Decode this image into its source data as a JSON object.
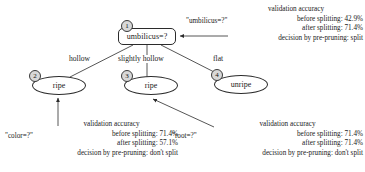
{
  "diagram": {
    "type": "decision-tree-pre-pruning",
    "nodes": [
      {
        "id": "1",
        "label": "umbilicus=?",
        "shape": "rounded-rect"
      },
      {
        "id": "2",
        "label": "ripe",
        "shape": "ellipse"
      },
      {
        "id": "3",
        "label": "ripe",
        "shape": "ellipse"
      },
      {
        "id": "4",
        "label": "unripe",
        "shape": "ellipse"
      }
    ],
    "edges": [
      {
        "from": "1",
        "to": "2",
        "label": "hollow"
      },
      {
        "from": "1",
        "to": "3",
        "label": "slightly hollow"
      },
      {
        "from": "1",
        "to": "4",
        "label": "flat"
      }
    ],
    "annotations": [
      {
        "id": "root-annotation",
        "attribute": "\"umbilicus=?\"",
        "title": "validation accuracy",
        "before_splitting": "before splitting: 42.9%",
        "after_splitting": "after splitting: 71.4%",
        "decision": "decision by pre-pruning: split",
        "target_node": "1"
      },
      {
        "id": "left-annotation",
        "attribute": "\"color=?\"",
        "title": "validation accuracy",
        "before_splitting": "before splitting: 71.4%",
        "after_splitting": "after splitting: 57.1%",
        "decision": "decision by pre-pruning: don't split",
        "target_node": "2"
      },
      {
        "id": "right-annotation",
        "attribute": "\"root=?\"",
        "title": "validation accuracy",
        "before_splitting": "before splitting: 71.4%",
        "after_splitting": "after splitting: 71.4%",
        "decision": "decision by pre-pruning: don't split",
        "target_node": "3"
      }
    ]
  }
}
